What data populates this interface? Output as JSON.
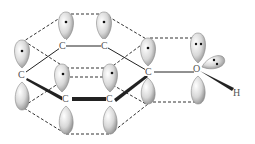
{
  "diagram": {
    "atoms": [
      {
        "id": "c1",
        "label": "C",
        "x": 62,
        "y": 46
      },
      {
        "id": "c2",
        "label": "C",
        "x": 104,
        "y": 46
      },
      {
        "id": "c3",
        "label": "C",
        "x": 22,
        "y": 75
      },
      {
        "id": "c4",
        "label": "C",
        "x": 149,
        "y": 72
      },
      {
        "id": "c5",
        "label": "C",
        "x": 66,
        "y": 99
      },
      {
        "id": "c6",
        "label": "C",
        "x": 110,
        "y": 99
      },
      {
        "id": "o",
        "label": "O",
        "x": 197,
        "y": 68
      },
      {
        "id": "h",
        "label": "H",
        "x": 237,
        "y": 91
      }
    ],
    "labels": {
      "c1": "C",
      "c2": "C",
      "c3": "C",
      "c4": "C",
      "c5": "C",
      "c6": "C",
      "o": "O",
      "h": "H"
    },
    "colors": {
      "lobe_light": "#f4f4f4",
      "lobe_dark": "#9a9a9a",
      "line": "#222222",
      "label": "#555555"
    }
  }
}
